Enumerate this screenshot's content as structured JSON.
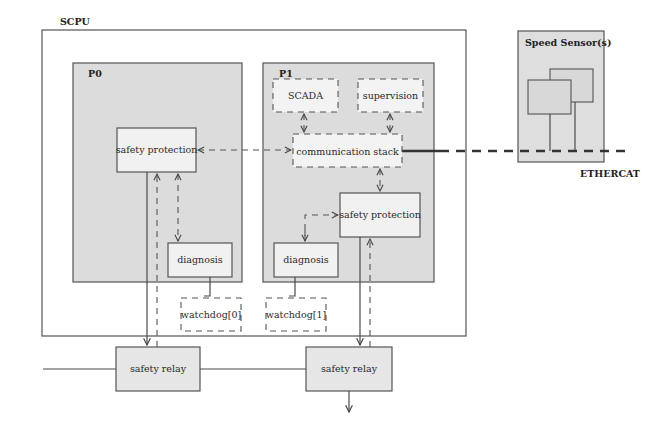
{
  "diagram": {
    "type": "block-diagram",
    "colors": {
      "background": "#ffffff",
      "processor_fill": "#dcdcdc",
      "box_fill": "#ececec",
      "line": "#4a4a4a"
    },
    "scpu": {
      "label": "SCPU"
    },
    "p0": {
      "label": "P0",
      "safety_protection": "safety protection",
      "diagnosis": "diagnosis"
    },
    "p1": {
      "label": "P1",
      "scada": "SCADA",
      "supervision": "supervision",
      "communication_stack": "communication stack",
      "safety_protection": "safety protection",
      "diagnosis": "diagnosis"
    },
    "watchdogs": [
      "watchdog[0]",
      "watchdog[1]"
    ],
    "relays": [
      "safety relay",
      "safety relay"
    ],
    "speed_sensor": {
      "label": "Speed Sensor(s)"
    },
    "bus": {
      "label": "ETHERCAT"
    },
    "connections": [
      {
        "from": "p0.safety_protection",
        "to": "p1.communication_stack",
        "style": "dashed",
        "arrows": "both"
      },
      {
        "from": "p0.safety_protection",
        "to": "p0.diagnosis",
        "style": "dashed",
        "arrows": "both"
      },
      {
        "from": "p0.safety_protection",
        "to": "relays.0",
        "style": "solid",
        "arrows": "end"
      },
      {
        "from": "relays.0",
        "to": "p0.safety_protection",
        "style": "dashed",
        "arrows": "end"
      },
      {
        "from": "p0.diagnosis",
        "to": "watchdogs.0",
        "style": "solid",
        "arrows": "none"
      },
      {
        "from": "p1.scada",
        "to": "p1.communication_stack",
        "style": "dashed",
        "arrows": "both"
      },
      {
        "from": "p1.supervision",
        "to": "p1.communication_stack",
        "style": "dashed",
        "arrows": "both"
      },
      {
        "from": "p1.communication_stack",
        "to": "p1.safety_protection",
        "style": "dashed",
        "arrows": "both"
      },
      {
        "from": "p1.diagnosis",
        "to": "p1.safety_protection",
        "style": "dashed",
        "arrows": "both"
      },
      {
        "from": "p1.safety_protection",
        "to": "relays.1",
        "style": "solid",
        "arrows": "end"
      },
      {
        "from": "relays.1",
        "to": "p1.safety_protection",
        "style": "dashed",
        "arrows": "end"
      },
      {
        "from": "p1.diagnosis",
        "to": "watchdogs.1",
        "style": "solid",
        "arrows": "none"
      },
      {
        "from": "p1.communication_stack",
        "to": "bus",
        "style": "thick",
        "arrows": "none"
      },
      {
        "from": "speed_sensor",
        "to": "bus",
        "style": "solid",
        "arrows": "none"
      },
      {
        "from": "relays.0",
        "to": "relays.1",
        "style": "solid",
        "arrows": "none"
      },
      {
        "from": "relays.1",
        "to": "output",
        "style": "solid",
        "arrows": "end"
      }
    ]
  }
}
